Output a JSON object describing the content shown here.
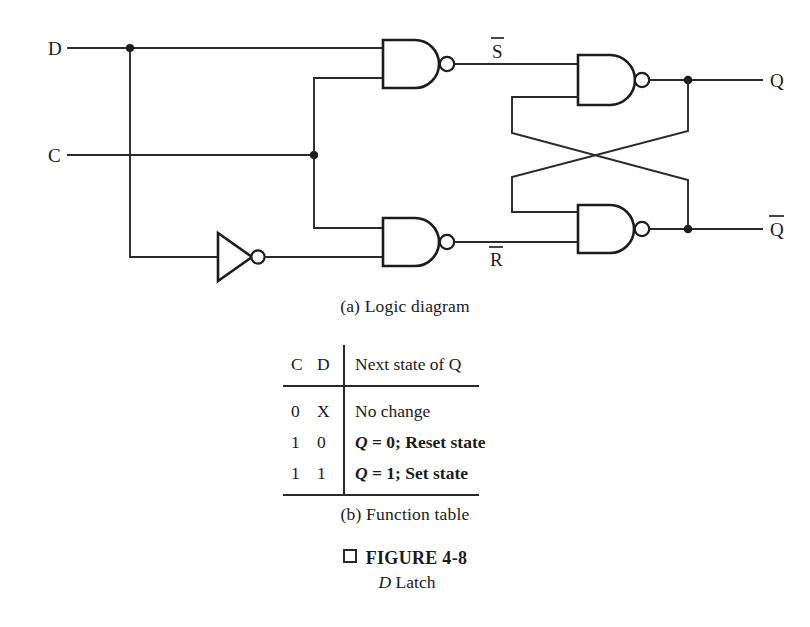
{
  "figure": {
    "caption_marker": "□",
    "caption_title": "FIGURE 4-8",
    "caption_subject_italic": "D",
    "caption_subject_rest": " Latch"
  },
  "diagram": {
    "part_label": "(a) Logic diagram",
    "inputs": [
      {
        "name": "D",
        "label": "D"
      },
      {
        "name": "C",
        "label": "C"
      }
    ],
    "internal_signals": [
      {
        "name": "S-bar",
        "label": "S",
        "overbar": true
      },
      {
        "name": "R-bar",
        "label": "R",
        "overbar": true
      }
    ],
    "outputs": [
      {
        "name": "Q",
        "label": "Q",
        "overbar": false
      },
      {
        "name": "Q-bar",
        "label": "Q",
        "overbar": true
      }
    ],
    "gates": [
      {
        "name": "nand-set",
        "type": "NAND",
        "inputs": [
          "D",
          "C"
        ],
        "output": "S-bar"
      },
      {
        "name": "nand-reset",
        "type": "NAND",
        "inputs": [
          "C",
          "D-inverted"
        ],
        "output": "R-bar"
      },
      {
        "name": "inverter-d",
        "type": "NOT",
        "inputs": [
          "D"
        ],
        "output": "D-inverted"
      },
      {
        "name": "nand-q",
        "type": "NAND",
        "inputs": [
          "S-bar",
          "Q-bar"
        ],
        "output": "Q"
      },
      {
        "name": "nand-qbar",
        "type": "NAND",
        "inputs": [
          "Q",
          "R-bar"
        ],
        "output": "Q-bar"
      }
    ]
  },
  "function_table": {
    "part_label": "(b) Function table",
    "headers": [
      "C",
      "D",
      "Next state of Q"
    ],
    "rows": [
      {
        "c": "0",
        "d": "X",
        "next_state": "No change",
        "next_state_q": "",
        "next_state_rest": "No change"
      },
      {
        "c": "1",
        "d": "0",
        "next_state": "Q = 0; Reset state",
        "next_state_q": "Q",
        "next_state_rest": " = 0; Reset state"
      },
      {
        "c": "1",
        "d": "1",
        "next_state": "Q = 1; Set state",
        "next_state_q": "Q",
        "next_state_rest": " = 1; Set state"
      }
    ]
  },
  "colors": {
    "background": "#ffffff",
    "ink": "#1a1a1a",
    "wire": "#2a2a2a"
  }
}
